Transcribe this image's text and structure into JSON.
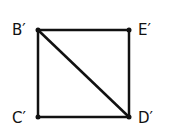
{
  "diagram": {
    "title": "",
    "stroke_color": "#111111",
    "vertices": [
      {
        "id": "B",
        "label": "B′",
        "x": 38,
        "y": 30
      },
      {
        "id": "E",
        "label": "E′",
        "x": 129,
        "y": 30
      },
      {
        "id": "C",
        "label": "C′",
        "x": 38,
        "y": 117
      },
      {
        "id": "D",
        "label": "D′",
        "x": 129,
        "y": 117
      }
    ],
    "edges": [
      [
        "B",
        "E"
      ],
      [
        "E",
        "D"
      ],
      [
        "D",
        "C"
      ],
      [
        "C",
        "B"
      ],
      [
        "B",
        "D"
      ]
    ]
  }
}
